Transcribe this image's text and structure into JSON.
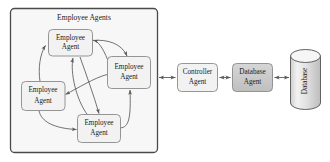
{
  "diagram": {
    "type": "block-diagram",
    "background_color": "#ffffff",
    "stroke_color": "#5a5a5a",
    "text_color": "#1a1a1a",
    "group": {
      "title": "Employee Agents",
      "fill": "#f7f7f7",
      "border_color": "#4a4a4a"
    },
    "agents": [
      {
        "id": "agent-top",
        "line1": "Employee",
        "line2": "Agent",
        "fill": "#f2f2f2"
      },
      {
        "id": "agent-right",
        "line1": "Employee",
        "line2": "Agent",
        "fill": "#f2f2f2"
      },
      {
        "id": "agent-left",
        "line1": "Employee",
        "line2": "Agent",
        "fill": "#f2f2f2"
      },
      {
        "id": "agent-bottom",
        "line1": "Employee",
        "line2": "Agent",
        "fill": "#f2f2f2"
      }
    ],
    "controller": {
      "line1": "Controller",
      "line2": "Agent",
      "fill": "#f2f2f2"
    },
    "database_agent": {
      "line1": "Database",
      "line2": "Agent",
      "fill": "#c9c9c9"
    },
    "database_store": {
      "label": "Database",
      "fill": "#e3e3e3",
      "top_fill": "#f6f6f6",
      "orientation": "vertical-text"
    },
    "connections": [
      {
        "from": "employee-agents-group",
        "to": "controller-agent",
        "style": "double-arrow"
      },
      {
        "from": "controller-agent",
        "to": "database-agent",
        "style": "double-arrow"
      },
      {
        "from": "database-agent",
        "to": "database-store",
        "style": "double-arrow"
      },
      {
        "from": "agent-left",
        "to": "agent-top",
        "style": "curved-arrow"
      },
      {
        "from": "agent-right",
        "to": "agent-top",
        "style": "curved-arrow"
      },
      {
        "from": "agent-bottom",
        "to": "agent-top",
        "style": "curved-arrow"
      },
      {
        "from": "agent-top",
        "to": "agent-right",
        "style": "curved-arrow"
      },
      {
        "from": "agent-right",
        "to": "agent-left",
        "style": "curved-arrow"
      },
      {
        "from": "agent-left",
        "to": "agent-bottom",
        "style": "curved-arrow"
      },
      {
        "from": "agent-bottom",
        "to": "agent-right",
        "style": "curved-arrow"
      },
      {
        "from": "agent-top",
        "to": "agent-bottom",
        "style": "curved-arrow"
      }
    ]
  }
}
